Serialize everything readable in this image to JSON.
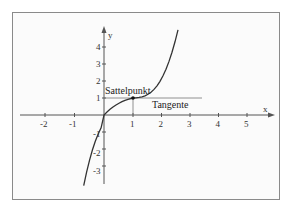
{
  "diagram": {
    "title": "",
    "function": "f(x) = (x-1)^3 + 1",
    "axes": {
      "x_label": "x",
      "y_label": "y",
      "x_ticks": [
        "-2",
        "-1",
        "1",
        "2",
        "3",
        "4",
        "5"
      ],
      "y_ticks_pos": [
        "1",
        "2",
        "3",
        "4"
      ],
      "y_ticks_neg": [
        "-1",
        "-2",
        "-3"
      ]
    },
    "annotations": {
      "saddle_point": "Sattelpunkt",
      "tangent": "Tangente"
    },
    "saddle_point_coords": [
      1,
      1
    ],
    "colors": {
      "curve": "#333333",
      "axes": "#555555",
      "frame": "#8a8a8a"
    }
  }
}
